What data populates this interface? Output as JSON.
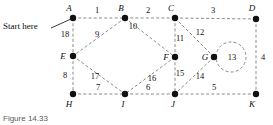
{
  "figure": {
    "caption": "Figure 14.33",
    "start_label": "Start here",
    "width": 273,
    "height": 125,
    "edge_color": "#8a8a8a",
    "node_color": "#111111",
    "background": "#ffffff"
  },
  "graph": {
    "type": "undirected-weighted-graph",
    "node_count": 11,
    "edge_count": 18,
    "start_node": "A",
    "nodes": [
      {
        "id": "A",
        "label": "A",
        "x": 73,
        "y": 18,
        "label_x": 69,
        "label_y": 11
      },
      {
        "id": "B",
        "label": "B",
        "x": 125,
        "y": 18,
        "label_x": 121,
        "label_y": 11
      },
      {
        "id": "C",
        "label": "C",
        "x": 175,
        "y": 18,
        "label_x": 171,
        "label_y": 11
      },
      {
        "id": "D",
        "label": "D",
        "x": 256,
        "y": 19,
        "label_x": 252,
        "label_y": 11
      },
      {
        "id": "E",
        "label": "E",
        "x": 73,
        "y": 56,
        "label_x": 63,
        "label_y": 59
      },
      {
        "id": "F",
        "label": "F",
        "x": 175,
        "y": 57,
        "label_x": 165,
        "label_y": 60
      },
      {
        "id": "G",
        "label": "G",
        "x": 214,
        "y": 57,
        "label_x": 204,
        "label_y": 60
      },
      {
        "id": "H",
        "label": "H",
        "x": 73,
        "y": 94,
        "label_x": 69,
        "label_y": 107
      },
      {
        "id": "I",
        "label": "I",
        "x": 125,
        "y": 94,
        "label_x": 122,
        "label_y": 107
      },
      {
        "id": "J",
        "label": "J",
        "x": 175,
        "y": 94,
        "label_x": 172,
        "label_y": 107
      },
      {
        "id": "K",
        "label": "K",
        "x": 256,
        "y": 94,
        "label_x": 252,
        "label_y": 107
      }
    ],
    "edges": [
      {
        "from": "A",
        "to": "B",
        "weight": "1",
        "label_x": 97,
        "label_y": 13
      },
      {
        "from": "B",
        "to": "C",
        "weight": "2",
        "label_x": 148,
        "label_y": 13
      },
      {
        "from": "C",
        "to": "D",
        "weight": "3",
        "label_x": 213,
        "label_y": 13
      },
      {
        "from": "D",
        "to": "K",
        "weight": "4",
        "label_x": 262,
        "label_y": 60
      },
      {
        "from": "J",
        "to": "K",
        "weight": "5",
        "label_x": 214,
        "label_y": 90
      },
      {
        "from": "I",
        "to": "J",
        "weight": "6",
        "label_x": 148,
        "label_y": 90
      },
      {
        "from": "H",
        "to": "I",
        "weight": "7",
        "label_x": 98,
        "label_y": 90
      },
      {
        "from": "E",
        "to": "H",
        "weight": "8",
        "label_x": 65,
        "label_y": 78
      },
      {
        "from": "B",
        "to": "E",
        "weight": "9",
        "label_x": 97,
        "label_y": 37
      },
      {
        "from": "B",
        "to": "F",
        "weight": "10",
        "label_x": 131,
        "label_y": 27
      },
      {
        "from": "C",
        "to": "F",
        "weight": "11",
        "label_x": 178,
        "label_y": 40
      },
      {
        "from": "C",
        "to": "G",
        "weight": "12",
        "label_x": 199,
        "label_y": 34
      },
      {
        "from": "G",
        "to": "G",
        "weight": "13",
        "label_x": 231,
        "label_y": 60,
        "self_loop": true
      },
      {
        "from": "G",
        "to": "J",
        "weight": "14",
        "label_x": 199,
        "label_y": 79
      },
      {
        "from": "F",
        "to": "J",
        "weight": "15",
        "label_x": 178,
        "label_y": 77
      },
      {
        "from": "F",
        "to": "I",
        "weight": "16",
        "label_x": 152,
        "label_y": 80
      },
      {
        "from": "E",
        "to": "I",
        "weight": "17",
        "label_x": 94,
        "label_y": 79
      },
      {
        "from": "A",
        "to": "E",
        "weight": "18",
        "label_x": 64,
        "label_y": 36
      }
    ]
  }
}
